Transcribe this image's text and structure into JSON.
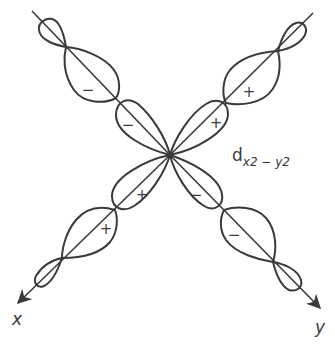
{
  "diagram": {
    "orbital_label": {
      "main": "d",
      "subscript": "x2 − y2",
      "full": "d_{x2 − y2}"
    },
    "axes": {
      "x_label": "x",
      "y_label": "y"
    },
    "lobes": {
      "upper_left_inner_sign": "−",
      "upper_left_middle_sign": "−",
      "upper_right_inner_sign": "+",
      "upper_right_middle_sign": "+",
      "lower_left_inner_sign": "+",
      "lower_left_middle_sign": "+",
      "lower_right_inner_sign": "−",
      "lower_right_middle_sign": "−"
    },
    "colors": {
      "stroke": "#3a3a3a",
      "background": "#ffffff"
    }
  }
}
